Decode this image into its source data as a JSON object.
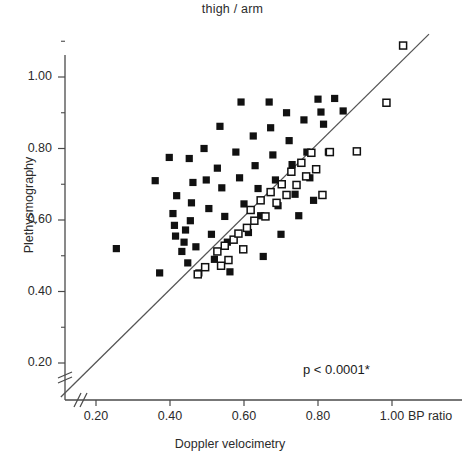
{
  "chart_data": {
    "type": "scatter",
    "title": "thigh / arm",
    "xlabel": "Doppler velocimetry",
    "ylabel": "Plethysmography",
    "unit_label": "BP ratio",
    "annotation": "p < 0.0001*",
    "xlim": [
      0.1,
      1.1
    ],
    "ylim": [
      0.1,
      1.12
    ],
    "axis_break": true,
    "grid": false,
    "legend": null,
    "xticks": [
      "0.20",
      "0.40",
      "0.60",
      "0.80",
      "1.00"
    ],
    "xtick_values": [
      0.2,
      0.4,
      0.6,
      0.8,
      1.0
    ],
    "yticks": [
      "0.20",
      "0.40",
      "0.60",
      "0.80",
      "1.00"
    ],
    "ytick_values": [
      0.2,
      0.4,
      0.6,
      0.8,
      1.0
    ],
    "minor_ytick_values": [
      0.3,
      0.5,
      0.7,
      0.9,
      1.1
    ],
    "identity_line": {
      "x0": 0.105,
      "y0": 0.105,
      "x1": 1.1,
      "y1": 1.12
    },
    "series": [
      {
        "name": "filled-squares",
        "marker": "filled-square",
        "color": "#111111",
        "points": [
          [
            0.255,
            0.52
          ],
          [
            0.36,
            0.71
          ],
          [
            0.372,
            0.452
          ],
          [
            0.398,
            0.775
          ],
          [
            0.408,
            0.618
          ],
          [
            0.412,
            0.585
          ],
          [
            0.415,
            0.555
          ],
          [
            0.418,
            0.668
          ],
          [
            0.432,
            0.512
          ],
          [
            0.448,
            0.48
          ],
          [
            0.452,
            0.772
          ],
          [
            0.455,
            0.598
          ],
          [
            0.458,
            0.648
          ],
          [
            0.462,
            0.705
          ],
          [
            0.47,
            0.525
          ],
          [
            0.478,
            0.452
          ],
          [
            0.492,
            0.8
          ],
          [
            0.498,
            0.712
          ],
          [
            0.505,
            0.632
          ],
          [
            0.512,
            0.56
          ],
          [
            0.52,
            0.49
          ],
          [
            0.528,
            0.745
          ],
          [
            0.535,
            0.862
          ],
          [
            0.54,
            0.69
          ],
          [
            0.548,
            0.61
          ],
          [
            0.555,
            0.538
          ],
          [
            0.562,
            0.455
          ],
          [
            0.578,
            0.79
          ],
          [
            0.588,
            0.718
          ],
          [
            0.592,
            0.93
          ],
          [
            0.6,
            0.645
          ],
          [
            0.612,
            0.565
          ],
          [
            0.625,
            0.835
          ],
          [
            0.63,
            0.752
          ],
          [
            0.638,
            0.688
          ],
          [
            0.645,
            0.612
          ],
          [
            0.652,
            0.498
          ],
          [
            0.668,
            0.93
          ],
          [
            0.672,
            0.858
          ],
          [
            0.678,
            0.782
          ],
          [
            0.685,
            0.712
          ],
          [
            0.692,
            0.64
          ],
          [
            0.7,
            0.56
          ],
          [
            0.715,
            0.9
          ],
          [
            0.722,
            0.822
          ],
          [
            0.73,
            0.755
          ],
          [
            0.738,
            0.672
          ],
          [
            0.748,
            0.612
          ],
          [
            0.762,
            0.88
          ],
          [
            0.77,
            0.79
          ],
          [
            0.778,
            0.718
          ],
          [
            0.788,
            0.655
          ],
          [
            0.8,
            0.938
          ],
          [
            0.808,
            0.902
          ],
          [
            0.815,
            0.868
          ],
          [
            0.828,
            0.79
          ],
          [
            0.845,
            0.94
          ],
          [
            0.868,
            0.905
          ],
          [
            0.438,
            0.538
          ],
          [
            0.442,
            0.572
          ]
        ]
      },
      {
        "name": "open-squares",
        "marker": "open-square",
        "color": "#111111",
        "points": [
          [
            0.475,
            0.448
          ],
          [
            0.528,
            0.512
          ],
          [
            0.548,
            0.528
          ],
          [
            0.558,
            0.488
          ],
          [
            0.572,
            0.545
          ],
          [
            0.585,
            0.562
          ],
          [
            0.598,
            0.518
          ],
          [
            0.608,
            0.578
          ],
          [
            0.618,
            0.628
          ],
          [
            0.628,
            0.598
          ],
          [
            0.645,
            0.655
          ],
          [
            0.658,
            0.61
          ],
          [
            0.672,
            0.678
          ],
          [
            0.688,
            0.648
          ],
          [
            0.702,
            0.7
          ],
          [
            0.715,
            0.67
          ],
          [
            0.728,
            0.735
          ],
          [
            0.742,
            0.698
          ],
          [
            0.755,
            0.76
          ],
          [
            0.768,
            0.722
          ],
          [
            0.782,
            0.788
          ],
          [
            0.795,
            0.742
          ],
          [
            0.812,
            0.67
          ],
          [
            0.832,
            0.79
          ],
          [
            0.905,
            0.792
          ],
          [
            0.985,
            0.928
          ],
          [
            1.03,
            1.088
          ],
          [
            0.495,
            0.468
          ],
          [
            0.538,
            0.472
          ]
        ]
      }
    ]
  }
}
